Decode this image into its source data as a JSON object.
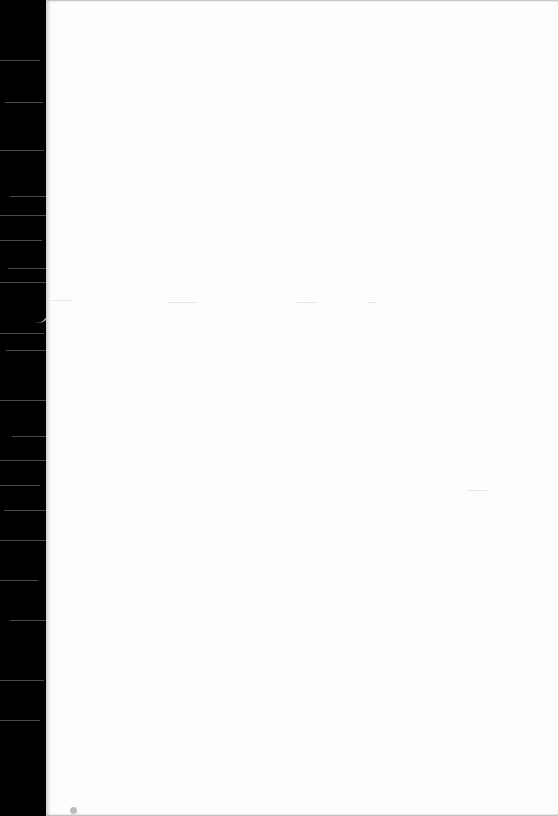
{
  "page": {
    "type": "blank scanned page",
    "background": "#fdfdfd",
    "edge_color": "#000000",
    "text": ""
  }
}
